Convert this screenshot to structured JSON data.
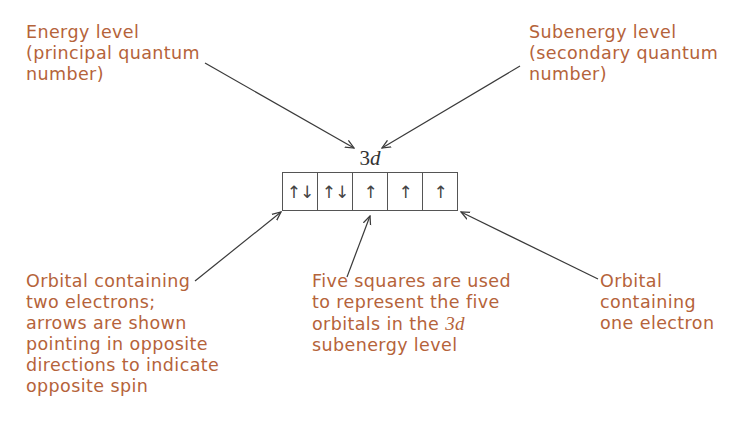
{
  "diagram": {
    "sublevel": {
      "number": "3",
      "letter": "d"
    },
    "orbitals": [
      {
        "electrons": "↑↓"
      },
      {
        "electrons": "↑↓"
      },
      {
        "electrons": "↑"
      },
      {
        "electrons": "↑"
      },
      {
        "electrons": "↑"
      }
    ],
    "labels": {
      "energy_level": [
        "Energy level",
        "(principal quantum",
        "number)"
      ],
      "subenergy_level": [
        "Subenergy level",
        "(secondary quantum",
        "number)"
      ],
      "two_electrons": [
        "Orbital containing",
        "two electrons;",
        "arrows are shown",
        "pointing in opposite",
        "directions to indicate",
        "opposite spin"
      ],
      "five_squares": {
        "lines": [
          "Five squares are used",
          "to represent the five"
        ],
        "line3_prefix": "orbitals in the ",
        "line3_italic": "3d",
        "line4": "subenergy level"
      },
      "one_electron": [
        "Orbital",
        "containing",
        "one electron"
      ]
    },
    "colors": {
      "label_text": "#B5633A",
      "arrow": "#3a3a3a",
      "box_border": "#555555"
    }
  }
}
